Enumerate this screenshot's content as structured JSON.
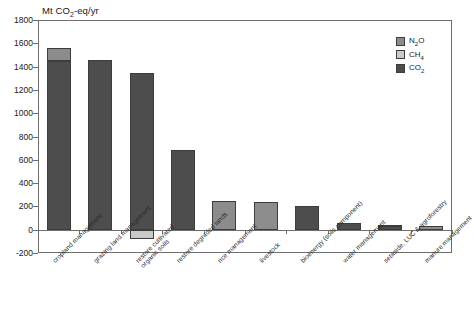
{
  "chart_data": {
    "type": "bar",
    "title": "Mt CO2-eq/yr",
    "title_parts": {
      "pre": "Mt CO",
      "sub": "2",
      "post": "-eq/yr"
    },
    "xlabel": "",
    "ylabel": "Mt CO2-eq/yr",
    "ylim": [
      -200,
      1800
    ],
    "ytick_step": 200,
    "yticks": [
      1800,
      1600,
      1400,
      1200,
      1000,
      800,
      600,
      400,
      200,
      0,
      -200
    ],
    "ytick_labels": [
      "1800",
      "1600",
      "1400",
      "1200",
      "1000",
      "800",
      "600",
      "400",
      "200",
      "0",
      "-200"
    ],
    "grid": false,
    "stacked": true,
    "legend_position": "top-right",
    "categories": [
      "cropland management",
      "grazing land management",
      "restore cultivated organic soils",
      "restore degraded lands",
      "rice management",
      "livestock",
      "bioenergy (soils component)",
      "water management",
      "setaside, LUC & agroforestry",
      "manure management"
    ],
    "category_lines": [
      [
        "cropland management"
      ],
      [
        "grazing land management"
      ],
      [
        "restore cultivated",
        "organic soils"
      ],
      [
        "restore degraded lands"
      ],
      [
        "rice management"
      ],
      [
        "livestock"
      ],
      [
        "bioenergy (soils component)"
      ],
      [
        "water management"
      ],
      [
        "setaside, LUC & agroforestry"
      ],
      [
        "manure management"
      ]
    ],
    "series": [
      {
        "name": "CO2",
        "legend_parts": {
          "pre": "CO",
          "sub": "2",
          "post": ""
        },
        "color": "#4d4d4d",
        "values": [
          1445,
          1460,
          1345,
          680,
          0,
          0,
          200,
          60,
          30,
          0
        ]
      },
      {
        "name": "CH4",
        "legend_parts": {
          "pre": "CH",
          "sub": "4",
          "post": ""
        },
        "color": "#c9c9c9",
        "values": [
          0,
          0,
          -80,
          0,
          0,
          0,
          0,
          0,
          0,
          0
        ]
      },
      {
        "name": "N2O",
        "legend_parts": {
          "pre": "N",
          "sub": "2",
          "post": "O"
        },
        "color": "#8c8c8c",
        "values": [
          115,
          0,
          0,
          0,
          245,
          235,
          0,
          0,
          8,
          30
        ]
      }
    ],
    "totals": [
      1560,
      1460,
      1345,
      680,
      245,
      235,
      200,
      60,
      38,
      30
    ],
    "colors": {
      "n2o": "#8c8c8c",
      "ch4": "#c9c9c9",
      "co2": "#4d4d4d",
      "axis": "#6e6e6e",
      "bar_edge": "#3d3d3d",
      "text": "#1a1a1a",
      "background": "#ffffff"
    }
  },
  "legend": {
    "items": [
      {
        "name": "N2O",
        "pre": "N",
        "sub": "2",
        "post": "O",
        "color": "#8c8c8c"
      },
      {
        "name": "CH4",
        "pre": "CH",
        "sub": "4",
        "post": "",
        "color": "#c9c9c9"
      },
      {
        "name": "CO2",
        "pre": "CO",
        "sub": "2",
        "post": "",
        "color": "#4d4d4d"
      }
    ]
  }
}
